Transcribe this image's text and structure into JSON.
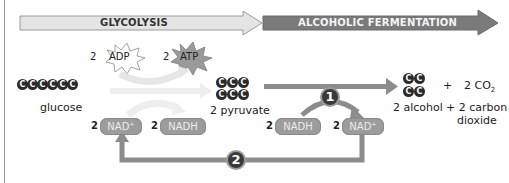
{
  "stages": {
    "glycolysis": "GLYCOLYSIS",
    "fermentation": "ALCOHOLIC FERMENTATION"
  },
  "molecules": {
    "glucose": {
      "label": "glucose",
      "carbons": 6,
      "atom": "C"
    },
    "pyruvate": {
      "label": "2 pyruvate",
      "carbons": 3,
      "count": 2,
      "atom": "C"
    },
    "alcohol": {
      "label": "2 alcohol",
      "carbons": 2,
      "count": 2,
      "atom": "C"
    },
    "co2": {
      "coef": "2",
      "formula": "CO",
      "subscript": "2"
    },
    "plus": "+",
    "carbon_dioxide_label_line1": "+ 2 carbon",
    "carbon_dioxide_label_line2": "dioxide"
  },
  "energy": {
    "adp": {
      "coef": "2",
      "label": "ADP"
    },
    "atp": {
      "coef": "2",
      "label": "ATP"
    }
  },
  "carriers": {
    "glycolysis_in": {
      "coef": "2",
      "label": "NAD⁺"
    },
    "glycolysis_out": {
      "coef": "2",
      "label": "NADH"
    },
    "fermentation_in": {
      "coef": "2",
      "label": "NADH"
    },
    "fermentation_out": {
      "coef": "2",
      "label": "NAD⁺"
    }
  },
  "steps": {
    "one": "1",
    "two": "2"
  },
  "colors": {
    "glycolysis_bar": "#e4e4e4",
    "fermentation_bar": "#7a7a7a",
    "pill": "#9c9c9c",
    "arrow": "#8c8c8c",
    "atom": "#2b2b2b",
    "step_circle": "#3a3a3a"
  }
}
